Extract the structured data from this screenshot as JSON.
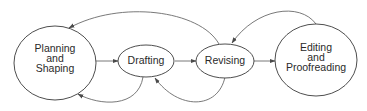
{
  "diagram": {
    "type": "process-cycle",
    "colors": {
      "node_stroke": "#3a3a3a",
      "edge_stroke": "#6a6a6a",
      "text": "#2a2a2a",
      "background": "#ffffff"
    },
    "nodes": [
      {
        "id": "planning",
        "label_lines": [
          "Planning",
          "and",
          "Shaping"
        ]
      },
      {
        "id": "drafting",
        "label_lines": [
          "Drafting"
        ]
      },
      {
        "id": "revising",
        "label_lines": [
          "Revising"
        ]
      },
      {
        "id": "editing",
        "label_lines": [
          "Editing",
          "and",
          "Proofreading"
        ]
      }
    ],
    "edges": [
      {
        "from": "planning",
        "to": "drafting",
        "style": "straight"
      },
      {
        "from": "drafting",
        "to": "revising",
        "style": "straight"
      },
      {
        "from": "revising",
        "to": "editing",
        "style": "straight"
      },
      {
        "from": "revising",
        "to": "planning",
        "style": "curved-top"
      },
      {
        "from": "editing",
        "to": "revising",
        "style": "curved-top"
      },
      {
        "from": "drafting",
        "to": "planning",
        "style": "curved-bottom"
      },
      {
        "from": "revising",
        "to": "drafting",
        "style": "curved-bottom"
      }
    ]
  }
}
